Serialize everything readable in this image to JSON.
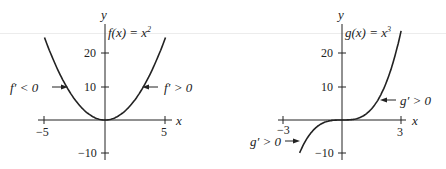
{
  "chart_data": [
    {
      "type": "line",
      "title": "f(x) = x^2",
      "function_label": "f(x) = x²",
      "xlabel": "x",
      "ylabel": "y",
      "xlim": [
        -5,
        5
      ],
      "ylim": [
        -10,
        25
      ],
      "x_ticks": [
        "-5",
        "5"
      ],
      "y_ticks": [
        "20",
        "10",
        "-10"
      ],
      "grid": false,
      "series": [
        {
          "name": "f(x) = x^2",
          "x": [
            -5,
            -4,
            -3,
            -2,
            -1,
            0,
            1,
            2,
            3,
            4,
            5
          ],
          "y": [
            25,
            16,
            9,
            4,
            1,
            0,
            1,
            4,
            9,
            16,
            25
          ]
        }
      ],
      "annotations": [
        {
          "text": "f′ < 0",
          "arrow_to": [
            -3.2,
            10.2
          ]
        },
        {
          "text": "f′ > 0",
          "arrow_to": [
            3.2,
            10.2
          ]
        }
      ]
    },
    {
      "type": "line",
      "title": "g(x) = x^3",
      "function_label": "g(x) = x³",
      "xlabel": "x",
      "ylabel": "y",
      "xlim": [
        -3,
        3
      ],
      "ylim": [
        -10,
        27
      ],
      "x_ticks": [
        "-3",
        "3"
      ],
      "y_ticks": [
        "20",
        "10",
        "-10"
      ],
      "grid": false,
      "series": [
        {
          "name": "g(x) = x^3",
          "x": [
            -2.15,
            -2,
            -1.5,
            -1,
            -0.5,
            0,
            0.5,
            1,
            1.5,
            2,
            2.5,
            3
          ],
          "y": [
            -9.94,
            -8,
            -3.375,
            -1,
            -0.125,
            0,
            0.125,
            1,
            3.375,
            8,
            15.625,
            27
          ]
        }
      ],
      "annotations": [
        {
          "text": "g′ > 0",
          "arrow_to": [
            1.95,
            7.5
          ]
        },
        {
          "text": "g′ > 0",
          "arrow_to": [
            -1.85,
            -6.3
          ]
        }
      ]
    }
  ],
  "left": {
    "y_axis_label": "y",
    "x_axis_label": "x",
    "func_name": "f(x) = x",
    "func_exp": "2",
    "tick_20": "20",
    "tick_10": "10",
    "tick_neg10": "−10",
    "tick_neg5": "−5",
    "tick_5": "5",
    "ann_left": "f′ < 0",
    "ann_right": "f′ > 0"
  },
  "right": {
    "y_axis_label": "y",
    "x_axis_label": "x",
    "func_name": "g(x) = x",
    "func_exp": "3",
    "tick_20": "20",
    "tick_10": "10",
    "tick_neg10": "−10",
    "tick_neg3": "−3",
    "tick_3": "3",
    "ann_right": "g′ > 0",
    "ann_left": "g′ > 0"
  },
  "style": {
    "ink": "#222222",
    "scanline": "#ececec"
  }
}
